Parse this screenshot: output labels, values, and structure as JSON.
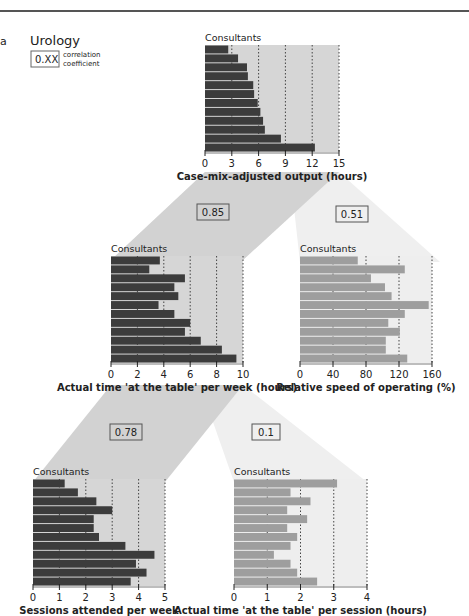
{
  "panel_letter": "a",
  "legend": {
    "title": "Urology",
    "box_text": "0.XX",
    "box_caption_line1": "correlation",
    "box_caption_line2": "coefficient"
  },
  "colors": {
    "dark_bar": "#3c3c3c",
    "light_bar": "#9e9e9e",
    "dark_plot_bg": "#d6d6d6",
    "light_plot_bg": "#eeeeee",
    "dark_band": "#d2d2d2",
    "light_band": "#efefef",
    "grid": "#444444"
  },
  "correlations": [
    {
      "id": "output-vs-time-week",
      "value": "0.85"
    },
    {
      "id": "output-vs-speed",
      "value": "0.51"
    },
    {
      "id": "time-week-vs-sessions",
      "value": "0.78"
    },
    {
      "id": "time-week-vs-time-session",
      "value": "0.1"
    }
  ],
  "chart_data": [
    {
      "id": "output",
      "type": "bar",
      "orientation": "horizontal",
      "title": "Consultants",
      "xlabel": "Case-mix-adjusted output (hours)",
      "ylabel": "Consultants",
      "xlim": [
        0,
        15
      ],
      "ticks": [
        0,
        3,
        6,
        9,
        12,
        15
      ],
      "grid": true,
      "style": "dark",
      "values": [
        2.6,
        3.7,
        4.7,
        4.8,
        5.4,
        5.5,
        5.9,
        6.2,
        6.5,
        6.7,
        8.5,
        12.3
      ]
    },
    {
      "id": "time-per-week",
      "type": "bar",
      "orientation": "horizontal",
      "title": "Consultants",
      "xlabel": "Actual time 'at the table' per week (hours)",
      "ylabel": "Consultants",
      "xlim": [
        0,
        10
      ],
      "ticks": [
        0,
        2,
        4,
        6,
        8,
        10
      ],
      "grid": true,
      "style": "dark",
      "values": [
        3.7,
        2.9,
        5.6,
        4.8,
        5.1,
        3.6,
        4.8,
        6.0,
        5.6,
        6.8,
        8.4,
        9.5
      ]
    },
    {
      "id": "speed",
      "type": "bar",
      "orientation": "horizontal",
      "title": "Consultants",
      "xlabel": "Relative speed of operating (%)",
      "ylabel": "Consultants",
      "xlim": [
        0,
        160
      ],
      "ticks": [
        0,
        40,
        80,
        120,
        160
      ],
      "grid": true,
      "style": "light",
      "values": [
        70,
        127,
        86,
        103,
        111,
        156,
        127,
        107,
        121,
        104,
        104,
        130
      ]
    },
    {
      "id": "sessions",
      "type": "bar",
      "orientation": "horizontal",
      "title": "Consultants",
      "xlabel": "Sessions attended per week",
      "ylabel": "Consultants",
      "xlim": [
        0,
        5
      ],
      "ticks": [
        0,
        1,
        2,
        3,
        4,
        5
      ],
      "grid": true,
      "style": "dark",
      "values": [
        1.2,
        1.7,
        2.4,
        3.0,
        2.3,
        2.3,
        2.5,
        3.5,
        4.6,
        3.9,
        4.3,
        3.7
      ]
    },
    {
      "id": "time-per-session",
      "type": "bar",
      "orientation": "horizontal",
      "title": "Consultants",
      "xlabel": "Actual time 'at the table' per session (hours)",
      "ylabel": "Consultants",
      "xlim": [
        0,
        4
      ],
      "ticks": [
        0,
        1,
        2,
        3,
        4
      ],
      "grid": true,
      "style": "light",
      "values": [
        3.1,
        1.7,
        2.3,
        1.6,
        2.2,
        1.6,
        1.9,
        1.7,
        1.2,
        1.7,
        1.9,
        2.5
      ]
    }
  ]
}
